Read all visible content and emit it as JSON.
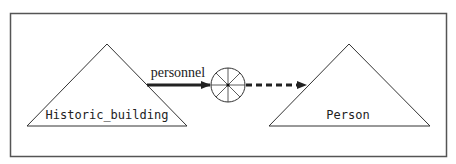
{
  "diagram": {
    "nodes": [
      {
        "id": "historic_building",
        "label": "Historic_building",
        "shape": "triangle"
      },
      {
        "id": "person",
        "label": "Person",
        "shape": "triangle"
      }
    ],
    "relationship": {
      "label": "personnel",
      "connector_icon": "wheel-circle-icon",
      "incoming_edge_style": "solid",
      "outgoing_edge_style": "dashed"
    },
    "colors": {
      "stroke": "#333333",
      "frame": "#555555",
      "background": "#ffffff"
    }
  }
}
